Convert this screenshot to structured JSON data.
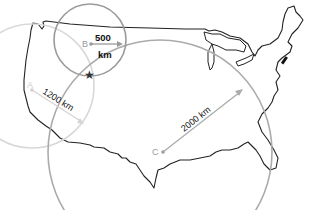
{
  "map": {
    "title": "Earthquake epicenter triangulation",
    "stations": [
      {
        "id": "A",
        "label": "A",
        "distance_label": "1200 km",
        "radius_km": 1200,
        "circle_color": "#d6d6d6",
        "label_color": "#cfcfcf"
      },
      {
        "id": "B",
        "label": "B",
        "distance_value": "500",
        "distance_unit": "km",
        "radius_km": 500,
        "circle_color": "#9a9a9a",
        "label_color": "#9a9a9a"
      },
      {
        "id": "C",
        "label": "C",
        "distance_label": "2000 km",
        "radius_km": 2000,
        "circle_color": "#aaaaaa",
        "label_color": "#9a9a9a"
      }
    ],
    "epicenter": {
      "label": "epicenter",
      "symbol": "★",
      "color": "#333333"
    },
    "outline_color": "#222222"
  }
}
